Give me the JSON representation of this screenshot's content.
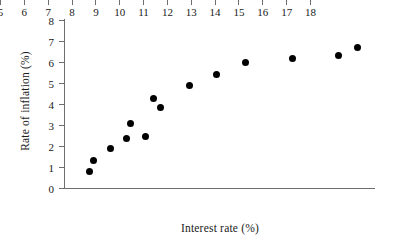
{
  "chart_data": {
    "type": "scatter",
    "title": "",
    "xlabel": "Interest rate (%)",
    "ylabel": "Rate of inflation (%)",
    "xlim": [
      5,
      18
    ],
    "ylim": [
      0,
      8
    ],
    "xticks": [
      5,
      6,
      7,
      8,
      9,
      10,
      11,
      12,
      13,
      14,
      15,
      16,
      17,
      18
    ],
    "yticks": [
      0,
      1,
      2,
      3,
      4,
      5,
      6,
      7,
      8
    ],
    "xtick_labels": [
      "5",
      "6",
      "7",
      "8",
      "9",
      "10",
      "11",
      "12",
      "13",
      "14",
      "15",
      "16",
      "17",
      "18"
    ],
    "ytick_labels": [
      "0",
      "1",
      "2",
      "3",
      "4",
      "5",
      "6",
      "7",
      "8"
    ],
    "grid": false,
    "legend": false,
    "marker": "filled-circle",
    "marker_color": "#000000",
    "axis_color": "#6e6e6e",
    "background_color": "#ffffff",
    "x": [
      6.05,
      6.25,
      6.95,
      7.6,
      7.8,
      8.4,
      8.75,
      9.05,
      10.25,
      11.4,
      12.6,
      14.6,
      16.5,
      17.3
    ],
    "y": [
      0.8,
      1.3,
      1.9,
      2.35,
      3.05,
      2.45,
      4.25,
      3.85,
      4.9,
      5.4,
      6.0,
      6.15,
      6.3,
      6.7
    ],
    "points": [
      {
        "x": 6.05,
        "y": 0.8
      },
      {
        "x": 6.25,
        "y": 1.3
      },
      {
        "x": 6.95,
        "y": 1.9
      },
      {
        "x": 7.6,
        "y": 2.35
      },
      {
        "x": 7.8,
        "y": 3.05
      },
      {
        "x": 8.4,
        "y": 2.45
      },
      {
        "x": 8.75,
        "y": 4.25
      },
      {
        "x": 9.05,
        "y": 3.85
      },
      {
        "x": 10.25,
        "y": 4.9
      },
      {
        "x": 11.4,
        "y": 5.4
      },
      {
        "x": 12.6,
        "y": 6.0
      },
      {
        "x": 14.6,
        "y": 6.15
      },
      {
        "x": 16.5,
        "y": 6.3
      },
      {
        "x": 17.3,
        "y": 6.7
      }
    ]
  }
}
